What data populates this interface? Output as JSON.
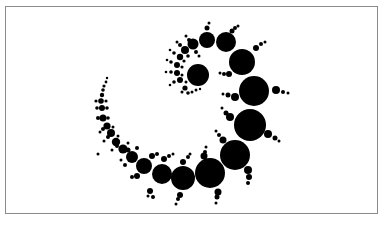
{
  "figure": {
    "frame_color": "#8a8a8a",
    "fill_color": "#000000",
    "background": "#ffffff"
  },
  "main_circles": [
    {
      "cx": 107,
      "cy": 78,
      "r": 1.2
    },
    {
      "cx": 106,
      "cy": 82,
      "r": 1.4
    },
    {
      "cx": 104,
      "cy": 86,
      "r": 1.6
    },
    {
      "cx": 103,
      "cy": 90,
      "r": 1.8
    },
    {
      "cx": 102,
      "cy": 95,
      "r": 2.2
    },
    {
      "cx": 101,
      "cy": 101,
      "r": 2.8
    },
    {
      "cx": 102,
      "cy": 108,
      "r": 3.0
    },
    {
      "cx": 103,
      "cy": 118,
      "r": 3.5
    },
    {
      "cx": 107,
      "cy": 126,
      "r": 3.6
    },
    {
      "cx": 111,
      "cy": 133,
      "r": 4.0
    },
    {
      "cx": 116,
      "cy": 142,
      "r": 4.2
    },
    {
      "cx": 123,
      "cy": 149,
      "r": 4.6
    },
    {
      "cx": 132,
      "cy": 157,
      "r": 6
    },
    {
      "cx": 144,
      "cy": 166,
      "r": 8
    },
    {
      "cx": 162,
      "cy": 174,
      "r": 10
    },
    {
      "cx": 183,
      "cy": 178,
      "r": 12
    },
    {
      "cx": 210,
      "cy": 173,
      "r": 15
    },
    {
      "cx": 235,
      "cy": 155,
      "r": 15
    },
    {
      "cx": 250,
      "cy": 125,
      "r": 16
    },
    {
      "cx": 254,
      "cy": 91,
      "r": 15
    },
    {
      "cx": 242,
      "cy": 62,
      "r": 13
    },
    {
      "cx": 226,
      "cy": 42,
      "r": 10
    },
    {
      "cx": 207,
      "cy": 40,
      "r": 8
    },
    {
      "cx": 193,
      "cy": 44,
      "r": 5.5
    },
    {
      "cx": 185,
      "cy": 50,
      "r": 4
    },
    {
      "cx": 180,
      "cy": 57,
      "r": 3.2
    },
    {
      "cx": 177,
      "cy": 65,
      "r": 3
    },
    {
      "cx": 177,
      "cy": 73,
      "r": 3
    },
    {
      "cx": 180,
      "cy": 80,
      "r": 3
    },
    {
      "cx": 185,
      "cy": 88,
      "r": 2.6
    },
    {
      "cx": 198,
      "cy": 75,
      "r": 11
    }
  ],
  "satellite_circles": [
    {
      "cx": 207,
      "cy": 28,
      "r": 2.5
    },
    {
      "cx": 209,
      "cy": 23,
      "r": 1.5
    },
    {
      "cx": 232,
      "cy": 31,
      "r": 2.5
    },
    {
      "cx": 235,
      "cy": 28,
      "r": 2
    },
    {
      "cx": 238,
      "cy": 26,
      "r": 1.5
    },
    {
      "cx": 229,
      "cy": 74,
      "r": 3
    },
    {
      "cx": 224,
      "cy": 74,
      "r": 2
    },
    {
      "cx": 220,
      "cy": 73,
      "r": 1.5
    },
    {
      "cx": 256,
      "cy": 48,
      "r": 3
    },
    {
      "cx": 261,
      "cy": 44,
      "r": 2
    },
    {
      "cx": 265,
      "cy": 42,
      "r": 1.5
    },
    {
      "cx": 235,
      "cy": 97,
      "r": 4
    },
    {
      "cx": 228,
      "cy": 95,
      "r": 2.5
    },
    {
      "cx": 223,
      "cy": 94,
      "r": 1.5
    },
    {
      "cx": 276,
      "cy": 90,
      "r": 4
    },
    {
      "cx": 283,
      "cy": 92,
      "r": 2
    },
    {
      "cx": 288,
      "cy": 93,
      "r": 1.5
    },
    {
      "cx": 230,
      "cy": 117,
      "r": 4
    },
    {
      "cx": 226,
      "cy": 113,
      "r": 2.5
    },
    {
      "cx": 222,
      "cy": 108,
      "r": 1.5
    },
    {
      "cx": 268,
      "cy": 134,
      "r": 4
    },
    {
      "cx": 275,
      "cy": 138,
      "r": 2.5
    },
    {
      "cx": 279,
      "cy": 141,
      "r": 1.5
    },
    {
      "cx": 223,
      "cy": 140,
      "r": 3.5
    },
    {
      "cx": 219,
      "cy": 135,
      "r": 2
    },
    {
      "cx": 216,
      "cy": 131,
      "r": 1.5
    },
    {
      "cx": 248,
      "cy": 170,
      "r": 4
    },
    {
      "cx": 249,
      "cy": 177,
      "r": 3
    },
    {
      "cx": 248,
      "cy": 183,
      "r": 2
    },
    {
      "cx": 204,
      "cy": 156,
      "r": 3.5
    },
    {
      "cx": 205,
      "cy": 152,
      "r": 2
    },
    {
      "cx": 206,
      "cy": 147,
      "r": 1.5
    },
    {
      "cx": 218,
      "cy": 192,
      "r": 3.5
    },
    {
      "cx": 217,
      "cy": 197,
      "r": 2.5
    },
    {
      "cx": 216,
      "cy": 203,
      "r": 1.5
    },
    {
      "cx": 183,
      "cy": 162,
      "r": 3
    },
    {
      "cx": 188,
      "cy": 157,
      "r": 2
    },
    {
      "cx": 190,
      "cy": 154,
      "r": 1.5
    },
    {
      "cx": 180,
      "cy": 195,
      "r": 3
    },
    {
      "cx": 178,
      "cy": 199,
      "r": 2
    },
    {
      "cx": 176,
      "cy": 204,
      "r": 1.5
    },
    {
      "cx": 164,
      "cy": 159,
      "r": 3
    },
    {
      "cx": 169,
      "cy": 156,
      "r": 2
    },
    {
      "cx": 173,
      "cy": 154,
      "r": 1.5
    },
    {
      "cx": 150,
      "cy": 191,
      "r": 3
    },
    {
      "cx": 153,
      "cy": 197,
      "r": 2
    },
    {
      "cx": 148,
      "cy": 196,
      "r": 1.5
    },
    {
      "cx": 152,
      "cy": 156,
      "r": 3
    },
    {
      "cx": 157,
      "cy": 154,
      "r": 2
    },
    {
      "cx": 137,
      "cy": 176,
      "r": 3
    },
    {
      "cx": 132,
      "cy": 177,
      "r": 2
    },
    {
      "cx": 128,
      "cy": 150,
      "r": 2.5
    },
    {
      "cx": 137,
      "cy": 148,
      "r": 2
    },
    {
      "cx": 125,
      "cy": 165,
      "r": 2
    },
    {
      "cx": 121,
      "cy": 160,
      "r": 1.5
    },
    {
      "cx": 117,
      "cy": 146,
      "r": 2
    },
    {
      "cx": 128,
      "cy": 143,
      "r": 1.5
    },
    {
      "cx": 112,
      "cy": 150,
      "r": 1.5
    },
    {
      "cx": 108,
      "cy": 137,
      "r": 2
    },
    {
      "cx": 118,
      "cy": 136,
      "r": 1.5
    },
    {
      "cx": 104,
      "cy": 141,
      "r": 1.5
    },
    {
      "cx": 103,
      "cy": 129,
      "r": 2
    },
    {
      "cx": 113,
      "cy": 127,
      "r": 1.5
    },
    {
      "cx": 100,
      "cy": 132,
      "r": 1.5
    },
    {
      "cx": 98,
      "cy": 118,
      "r": 2
    },
    {
      "cx": 108,
      "cy": 118,
      "r": 1.8
    },
    {
      "cx": 97,
      "cy": 108,
      "r": 1.8
    },
    {
      "cx": 107,
      "cy": 108,
      "r": 1.8
    },
    {
      "cx": 96,
      "cy": 101,
      "r": 1.6
    },
    {
      "cx": 106,
      "cy": 101,
      "r": 1.6
    },
    {
      "cx": 98,
      "cy": 154,
      "r": 1.5
    },
    {
      "cx": 189,
      "cy": 40,
      "r": 2
    },
    {
      "cx": 186,
      "cy": 36,
      "r": 1.5
    },
    {
      "cx": 196,
      "cy": 52,
      "r": 2
    },
    {
      "cx": 199,
      "cy": 56,
      "r": 1.5
    },
    {
      "cx": 180,
      "cy": 45,
      "r": 2
    },
    {
      "cx": 177,
      "cy": 42,
      "r": 1.5
    },
    {
      "cx": 188,
      "cy": 56,
      "r": 1.8
    },
    {
      "cx": 174,
      "cy": 53,
      "r": 1.8
    },
    {
      "cx": 170,
      "cy": 50,
      "r": 1.3
    },
    {
      "cx": 184,
      "cy": 61,
      "r": 1.6
    },
    {
      "cx": 171,
      "cy": 62,
      "r": 1.8
    },
    {
      "cx": 167,
      "cy": 60,
      "r": 1.3
    },
    {
      "cx": 182,
      "cy": 67,
      "r": 1.6
    },
    {
      "cx": 171,
      "cy": 72,
      "r": 1.8
    },
    {
      "cx": 166,
      "cy": 72,
      "r": 1.3
    },
    {
      "cx": 182,
      "cy": 75,
      "r": 1.5
    },
    {
      "cx": 174,
      "cy": 82,
      "r": 1.8
    },
    {
      "cx": 170,
      "cy": 85,
      "r": 1.3
    },
    {
      "cx": 186,
      "cy": 82,
      "r": 1.5
    },
    {
      "cx": 188,
      "cy": 93,
      "r": 1.8
    },
    {
      "cx": 192,
      "cy": 92,
      "r": 1.5
    },
    {
      "cx": 182,
      "cy": 92,
      "r": 1.5
    },
    {
      "cx": 196,
      "cy": 90,
      "r": 1.5
    },
    {
      "cx": 200,
      "cy": 89,
      "r": 1.2
    }
  ]
}
